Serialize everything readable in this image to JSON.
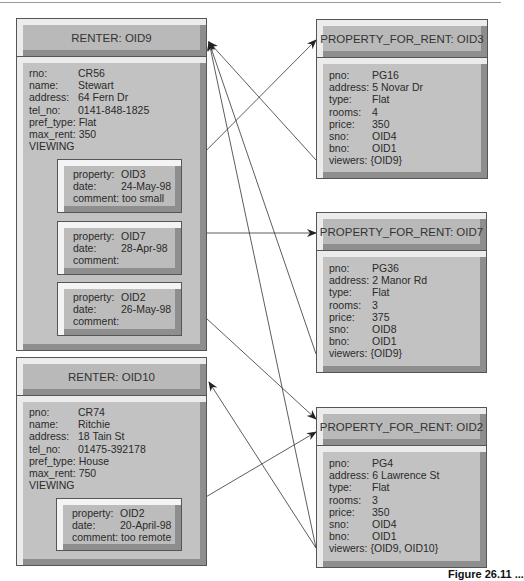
{
  "renters": [
    {
      "title": "RENTER: OID9",
      "fields": [
        {
          "key": "rno:",
          "value": "CR56"
        },
        {
          "key": "name:",
          "value": "Stewart"
        },
        {
          "key": "address:",
          "value": "64 Fern Dr"
        },
        {
          "key": "tel_no:",
          "value": "0141-848-1825"
        },
        {
          "key": "pref_type:",
          "value": "Flat"
        },
        {
          "key": "max_rent:",
          "value": "350"
        }
      ],
      "viewing_label": "VIEWING",
      "viewings": [
        {
          "property_key": "property:",
          "property": "OID3",
          "date_key": "date:",
          "date": "24-May-98",
          "comment_key": "comment:",
          "comment": "too small"
        },
        {
          "property_key": "property:",
          "property": "OID7",
          "date_key": "date:",
          "date": "28-Apr-98",
          "comment_key": "comment:",
          "comment": ""
        },
        {
          "property_key": "property:",
          "property": "OID2",
          "date_key": "date:",
          "date": "26-May-98",
          "comment_key": "comment:",
          "comment": ""
        }
      ]
    },
    {
      "title": "RENTER: OID10",
      "fields": [
        {
          "key": "pno:",
          "value": "CR74"
        },
        {
          "key": "name:",
          "value": "Ritchie"
        },
        {
          "key": "address:",
          "value": "18 Tain St"
        },
        {
          "key": "tel_no:",
          "value": "01475-392178"
        },
        {
          "key": "pref_type:",
          "value": "House"
        },
        {
          "key": "max_rent:",
          "value": "750"
        }
      ],
      "viewing_label": "VIEWING",
      "viewings": [
        {
          "property_key": "property:",
          "property": "OID2",
          "date_key": "date:",
          "date": "20-April-98",
          "comment_key": "comment:",
          "comment": "too remote"
        }
      ]
    }
  ],
  "properties": [
    {
      "title": "PROPERTY_FOR_RENT: OID3",
      "fields": [
        {
          "key": "pno:",
          "value": "PG16"
        },
        {
          "key": "address:",
          "value": "5 Novar Dr"
        },
        {
          "key": "type:",
          "value": "Flat"
        },
        {
          "key": "rooms:",
          "value": "4"
        },
        {
          "key": "price:",
          "value": "350"
        },
        {
          "key": "sno:",
          "value": "OID4"
        },
        {
          "key": "bno:",
          "value": "OID1"
        },
        {
          "key": "viewers:",
          "value": "{OID9}"
        }
      ]
    },
    {
      "title": "PROPERTY_FOR_RENT: OID7",
      "fields": [
        {
          "key": "pno:",
          "value": "PG36"
        },
        {
          "key": "address:",
          "value": "2 Manor Rd"
        },
        {
          "key": "type:",
          "value": "Flat"
        },
        {
          "key": "rooms:",
          "value": "3"
        },
        {
          "key": "price:",
          "value": "375"
        },
        {
          "key": "sno:",
          "value": "OID8"
        },
        {
          "key": "bno:",
          "value": "OID1"
        },
        {
          "key": "viewers:",
          "value": "{OID9}"
        }
      ]
    },
    {
      "title": "PROPERTY_FOR_RENT: OID2",
      "fields": [
        {
          "key": "pno:",
          "value": "PG4"
        },
        {
          "key": "address:",
          "value": "6 Lawrence St"
        },
        {
          "key": "type:",
          "value": "Flat"
        },
        {
          "key": "rooms:",
          "value": "3"
        },
        {
          "key": "price:",
          "value": "350"
        },
        {
          "key": "sno:",
          "value": "OID4"
        },
        {
          "key": "bno:",
          "value": "OID1"
        },
        {
          "key": "viewers:",
          "value": "{OID9, OID10}"
        }
      ]
    }
  ],
  "caption": "Figure 26.11 ..."
}
